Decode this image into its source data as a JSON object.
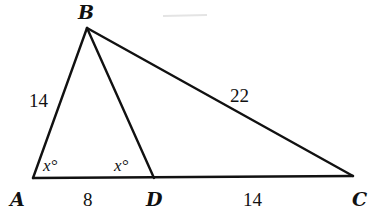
{
  "diagram": {
    "type": "triangle-geometry",
    "colors": {
      "line": "#111111",
      "background": "#ffffff"
    },
    "vertices": {
      "A": {
        "label": "A",
        "x": 33,
        "y": 178
      },
      "B": {
        "label": "B",
        "x": 87,
        "y": 28
      },
      "C": {
        "label": "C",
        "x": 353,
        "y": 176
      },
      "D": {
        "label": "D",
        "x": 154,
        "y": 178
      }
    },
    "segments": [
      {
        "from": "A",
        "to": "B",
        "length_label": "14"
      },
      {
        "from": "B",
        "to": "C",
        "length_label": "22"
      },
      {
        "from": "A",
        "to": "D",
        "length_label": "8"
      },
      {
        "from": "D",
        "to": "C",
        "length_label": "14"
      },
      {
        "from": "B",
        "to": "D",
        "length_label": ""
      }
    ],
    "angles": [
      {
        "at": "A",
        "label": "x°",
        "between": [
          "B",
          "D"
        ]
      },
      {
        "at": "D",
        "label": "x°",
        "between": [
          "A",
          "B"
        ]
      }
    ]
  }
}
